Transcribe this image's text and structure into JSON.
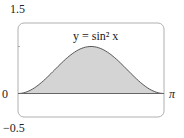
{
  "chart_data": {
    "type": "area",
    "title": "",
    "annotation": "y = sin² x",
    "function": "sin^2(x)",
    "xlabel": "",
    "ylabel": "",
    "xlim": [
      0,
      3.14159
    ],
    "ylim": [
      -0.5,
      1.5
    ],
    "x_tick_labels": [
      "0",
      "π"
    ],
    "y_tick_labels": [
      "1.5",
      "0",
      "−0.5"
    ],
    "grid": false,
    "x": [
      0,
      0.3927,
      0.7854,
      1.1781,
      1.5708,
      1.9635,
      2.3562,
      2.7489,
      3.1416
    ],
    "values": [
      0,
      0.1464,
      0.5,
      0.8536,
      1,
      0.8536,
      0.5,
      0.1464,
      0
    ],
    "fill_color": "#d4d4d4",
    "line_color": "#555555"
  },
  "labels": {
    "y_top": "1.5",
    "y_zero": "0",
    "y_bottom": "−0.5",
    "x_end": "π",
    "curve": "y = sin² x"
  }
}
